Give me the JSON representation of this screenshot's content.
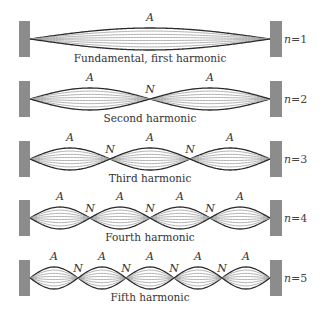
{
  "figure": {
    "colors": {
      "wall": "#8c8c8c",
      "string_dark": "#2a2a2a",
      "string_light": "#a0a0a0",
      "text": "#333333"
    },
    "antinode_label": "A",
    "node_label": "N",
    "rows": [
      {
        "n": 1,
        "n_label": "n = 1",
        "caption": "Fundamental, first harmonic",
        "loops": 1,
        "antinodes": [
          "A"
        ],
        "nodes": []
      },
      {
        "n": 2,
        "n_label": "n = 2",
        "caption": "Second harmonic",
        "loops": 2,
        "antinodes": [
          "A",
          "A"
        ],
        "nodes": [
          "N"
        ]
      },
      {
        "n": 3,
        "n_label": "n = 3",
        "caption": "Third harmonic",
        "loops": 3,
        "antinodes": [
          "A",
          "A",
          "A"
        ],
        "nodes": [
          "N",
          "N"
        ]
      },
      {
        "n": 4,
        "n_label": "n = 4",
        "caption": "Fourth harmonic",
        "loops": 4,
        "antinodes": [
          "A",
          "A",
          "A",
          "A"
        ],
        "nodes": [
          "N",
          "N",
          "N"
        ]
      },
      {
        "n": 5,
        "n_label": "n = 5",
        "caption": "Fifth harmonic",
        "loops": 5,
        "antinodes": [
          "A",
          "A",
          "A",
          "A",
          "A"
        ],
        "nodes": [
          "N",
          "N",
          "N",
          "N"
        ]
      }
    ]
  }
}
